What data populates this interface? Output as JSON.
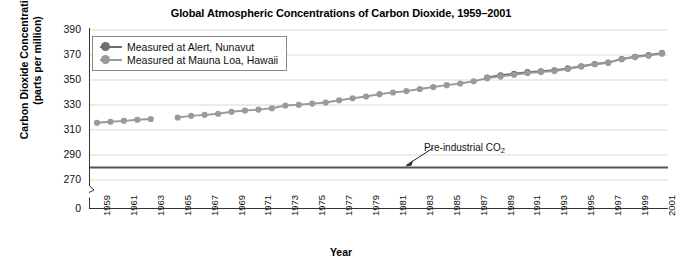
{
  "chart_data": {
    "type": "line",
    "title": "Global Atmospheric Concentrations of Carbon Dioxide, 1959–2001",
    "xlabel": "Year",
    "ylabel_line1": "Carbon Dioxide Concentrations",
    "ylabel_line2": "(parts per million)",
    "xlim": [
      1959,
      2001
    ],
    "ylim": [
      270,
      390
    ],
    "yticks": [
      0,
      270,
      290,
      310,
      330,
      350,
      370,
      390
    ],
    "ytick_labels": [
      "0",
      "270",
      "290",
      "310",
      "330",
      "350",
      "370",
      "390"
    ],
    "axis_break": true,
    "grid": "horizontal",
    "legend_position": "top-left",
    "xticks": [
      1959,
      1961,
      1963,
      1965,
      1967,
      1969,
      1971,
      1973,
      1975,
      1977,
      1979,
      1981,
      1983,
      1985,
      1987,
      1989,
      1991,
      1993,
      1995,
      1997,
      1999,
      2001
    ],
    "xtick_labels": [
      "1959",
      "1961",
      "1963",
      "1965",
      "1967",
      "1969",
      "1971",
      "1973",
      "1975",
      "1977",
      "1979",
      "1981",
      "1983",
      "1985",
      "1987",
      "1989",
      "1991",
      "1993",
      "1995",
      "1997",
      "1999",
      "2001"
    ],
    "x_minor_years": [
      1960,
      1962,
      1964,
      1966,
      1968,
      1970,
      1972,
      1974,
      1976,
      1978,
      1980,
      1982,
      1984,
      1986,
      1988,
      1990,
      1992,
      1994,
      1996,
      1998,
      2000
    ],
    "series": [
      {
        "name": "Measured at Alert, Nunavut",
        "color": "#6e6e6e",
        "marker": "circle",
        "points": [
          {
            "x": 1988,
            "y": 352.0
          },
          {
            "x": 1989,
            "y": 353.8
          },
          {
            "x": 1990,
            "y": 355.0
          },
          {
            "x": 1991,
            "y": 356.3
          },
          {
            "x": 1992,
            "y": 357.0
          },
          {
            "x": 1993,
            "y": 357.8
          },
          {
            "x": 1994,
            "y": 359.3
          },
          {
            "x": 1995,
            "y": 361.0
          },
          {
            "x": 1996,
            "y": 362.8
          },
          {
            "x": 1997,
            "y": 364.0
          },
          {
            "x": 1998,
            "y": 366.8
          },
          {
            "x": 1999,
            "y": 368.6
          },
          {
            "x": 2000,
            "y": 370.0
          },
          {
            "x": 2001,
            "y": 371.5
          }
        ]
      },
      {
        "name": "Measured at Mauna Loa, Hawaii",
        "color": "#9a9a9a",
        "marker": "circle",
        "points": [
          {
            "x": 1959,
            "y": 315.8
          },
          {
            "x": 1960,
            "y": 316.6
          },
          {
            "x": 1961,
            "y": 317.3
          },
          {
            "x": 1962,
            "y": 318.2
          },
          {
            "x": 1963,
            "y": 318.8
          },
          {
            "x": 1965,
            "y": 320.0
          },
          {
            "x": 1966,
            "y": 321.3
          },
          {
            "x": 1967,
            "y": 322.1
          },
          {
            "x": 1968,
            "y": 323.0
          },
          {
            "x": 1969,
            "y": 324.6
          },
          {
            "x": 1970,
            "y": 325.6
          },
          {
            "x": 1971,
            "y": 326.3
          },
          {
            "x": 1972,
            "y": 327.4
          },
          {
            "x": 1973,
            "y": 329.6
          },
          {
            "x": 1974,
            "y": 330.2
          },
          {
            "x": 1975,
            "y": 331.1
          },
          {
            "x": 1976,
            "y": 332.0
          },
          {
            "x": 1977,
            "y": 333.8
          },
          {
            "x": 1978,
            "y": 335.4
          },
          {
            "x": 1979,
            "y": 336.8
          },
          {
            "x": 1980,
            "y": 338.7
          },
          {
            "x": 1981,
            "y": 340.0
          },
          {
            "x": 1982,
            "y": 341.1
          },
          {
            "x": 1983,
            "y": 342.8
          },
          {
            "x": 1984,
            "y": 344.4
          },
          {
            "x": 1985,
            "y": 345.9
          },
          {
            "x": 1986,
            "y": 347.2
          },
          {
            "x": 1987,
            "y": 349.0
          },
          {
            "x": 1988,
            "y": 351.5
          },
          {
            "x": 1989,
            "y": 352.9
          },
          {
            "x": 1990,
            "y": 354.2
          },
          {
            "x": 1991,
            "y": 355.6
          },
          {
            "x": 1992,
            "y": 356.4
          },
          {
            "x": 1993,
            "y": 357.1
          },
          {
            "x": 1994,
            "y": 358.8
          },
          {
            "x": 1995,
            "y": 360.8
          },
          {
            "x": 1996,
            "y": 362.6
          },
          {
            "x": 1997,
            "y": 363.8
          },
          {
            "x": 1998,
            "y": 366.6
          },
          {
            "x": 1999,
            "y": 368.3
          },
          {
            "x": 2000,
            "y": 369.5
          },
          {
            "x": 2001,
            "y": 371.1
          }
        ]
      }
    ],
    "reference_line": {
      "label_text": "Pre-industrial CO",
      "label_sub": "2",
      "value": 280,
      "color": "#555555"
    }
  }
}
